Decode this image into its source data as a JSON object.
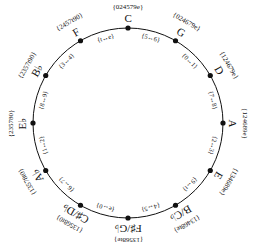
{
  "diagram": {
    "type": "circle-of-fifths",
    "center": [
      128,
      123
    ],
    "radius": 95,
    "line_color": "#111111",
    "nodes": [
      {
        "note": "C",
        "set": "{024579e}",
        "angle": 0
      },
      {
        "note": "G",
        "set": "{024679e}",
        "angle": 30
      },
      {
        "note": "D",
        "set": "{124679e}",
        "angle": 60
      },
      {
        "note": "A",
        "set": "{124689e}",
        "angle": 90
      },
      {
        "note": "E",
        "set": "{134689e}",
        "angle": 120
      },
      {
        "note": "B/C♭",
        "set": "{13468te}",
        "angle": 150
      },
      {
        "note": "F♯/G♭",
        "set": "{13568te}",
        "angle": 180
      },
      {
        "note": "C♯/D♭",
        "set": "{13568t0}",
        "angle": 210
      },
      {
        "note": "A♭",
        "set": "{13578t0}",
        "angle": 240
      },
      {
        "note": "E♭",
        "set": "{235780}",
        "angle": 270
      },
      {
        "note": "B♭",
        "set": "{2357t90}",
        "angle": 300
      },
      {
        "note": "F",
        "set": "{2457t90}",
        "angle": 330
      }
    ],
    "transitions": [
      {
        "label": "{5↔6}",
        "angle": 15
      },
      {
        "label": "{0↔1}",
        "angle": 45
      },
      {
        "label": "{7↔8}",
        "angle": 75
      },
      {
        "label": "{2↔3}",
        "angle": 105
      },
      {
        "label": "{9↔t}",
        "angle": 135
      },
      {
        "label": "{4↔5}",
        "angle": 165
      },
      {
        "label": "{e↔0}",
        "angle": 195
      },
      {
        "label": "{6↔7}",
        "angle": 225
      },
      {
        "label": "{1↔2}",
        "angle": 255
      },
      {
        "label": "{8↔9}",
        "angle": 285
      },
      {
        "label": "{3↔4}",
        "angle": 315
      },
      {
        "label": "{t↔e}",
        "angle": 345
      }
    ]
  }
}
